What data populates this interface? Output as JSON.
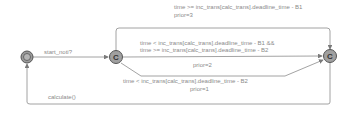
{
  "diagram": {
    "type": "timed-automaton",
    "colors": {
      "edge": "#8c8c8c",
      "state_fill": "#9a9a9a",
      "state_stroke": "#555555",
      "text": "#8a8a8a"
    },
    "states": [
      {
        "id": "init",
        "kind": "initial",
        "label": ""
      },
      {
        "id": "c1",
        "kind": "committed",
        "label": "C"
      },
      {
        "id": "c2",
        "kind": "committed",
        "label": "C"
      }
    ],
    "edges": [
      {
        "id": "e_start",
        "from": "init",
        "to": "c1",
        "sync": "start_noti?"
      },
      {
        "id": "e_top",
        "from": "c1",
        "to": "c2",
        "guard": "time >= inc_trans[calc_trans].deadline_time - B1",
        "prior": "prior=3"
      },
      {
        "id": "e_mid",
        "from": "c1",
        "to": "c2",
        "guard_line1": "time < inc_trans[calc_trans].deadline_time - B1 &&",
        "guard_line2": "time >= inc_trans[calc_trans].deadline_time - B2",
        "prior": "prior=2"
      },
      {
        "id": "e_bot",
        "from": "c1",
        "to": "c2",
        "guard": "time < inc_trans[calc_trans].deadline_time - B2",
        "prior": "prior=1"
      },
      {
        "id": "e_return",
        "from": "c2",
        "to": "init",
        "update": "calculate()"
      }
    ]
  }
}
